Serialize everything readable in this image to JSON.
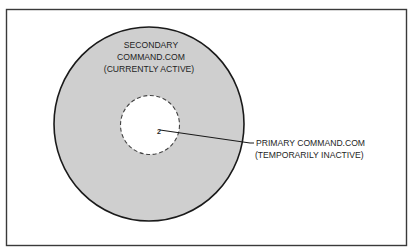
{
  "diagram": {
    "colors": {
      "frame": "#3a3a3a",
      "outer_fill": "#cfcfcf",
      "outer_stroke": "#1a1a1a",
      "inner_fill": "#ffffff",
      "inner_stroke": "#444444",
      "text": "#1e1e1e",
      "background": "#ffffff"
    },
    "outer_circle": {
      "label_lines": [
        "SECONDARY",
        "COMMAND.COM",
        "(CURRENTLY ACTIVE)"
      ]
    },
    "inner_circle": {
      "marker": "2",
      "style": "dashed"
    },
    "callout": {
      "label_lines": [
        "PRIMARY COMMAND.COM",
        "(TEMPORARILY INACTIVE)"
      ]
    }
  }
}
